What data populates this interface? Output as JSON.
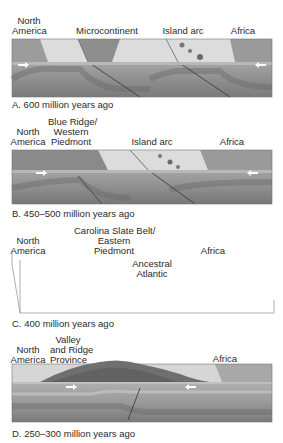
{
  "figure": {
    "panels": [
      {
        "id": "A",
        "caption": "A. 600 million years ago",
        "labels": [
          "North\nAmerica",
          "Microcontinent",
          "Island arc",
          "Africa"
        ]
      },
      {
        "id": "B",
        "caption": "B. 450–500 million years ago",
        "labels": [
          "North\nAmerica",
          "Blue Ridge/\nWestern\nPiedmont",
          "Island arc",
          "Africa"
        ]
      },
      {
        "id": "C",
        "caption": "C. 400 million years ago",
        "labels": [
          "North\nAmerica",
          "Carolina Slate Belt/\nEastern\nPiedmont",
          "Ancestral\nAtlantic",
          "Africa"
        ]
      },
      {
        "id": "D",
        "caption": "D. 250–300 million years ago",
        "labels": [
          "North\nAmerica",
          "Valley\nand Ridge\nProvince",
          "Africa"
        ]
      }
    ],
    "icons": {
      "arrow_right": "plate-motion-arrow-east",
      "arrow_left": "plate-motion-arrow-west"
    },
    "colors": {
      "surface_light": "#d9d9d9",
      "surface_mid": "#bdbdbd",
      "crust": "#9a9a9a",
      "mantle_dark": "#6e6e6e",
      "continent_texture": "#8a8a8a",
      "outline": "#555555"
    }
  }
}
